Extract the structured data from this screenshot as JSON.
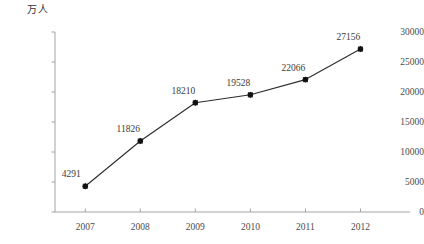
{
  "chart_data": {
    "type": "line",
    "title": "",
    "subtitle": "",
    "xlabel": "",
    "ylabel": "万人",
    "ylabel_position": "top-left-above-axis",
    "categories": [
      "2007",
      "2008",
      "2009",
      "2010",
      "2011",
      "2012"
    ],
    "x": [
      2007,
      2008,
      2009,
      2010,
      2011,
      2012
    ],
    "values": [
      4291,
      11826,
      18210,
      19528,
      22066,
      27156
    ],
    "data_labels": [
      "4291",
      "11826",
      "18210",
      "19528",
      "22066",
      "27156"
    ],
    "data_labels_visible": true,
    "ylim": [
      0,
      30000
    ],
    "yticks": [
      0,
      5000,
      10000,
      15000,
      20000,
      25000,
      30000
    ],
    "ytick_labels": [
      "0",
      "5000",
      "10000",
      "15000",
      "20000",
      "25000",
      "30000"
    ],
    "xtick_labels": [
      "2007",
      "2008",
      "2009",
      "2010",
      "2011",
      "2012"
    ],
    "grid": false,
    "legend": false,
    "legend_position": "none",
    "series": [
      {
        "name": "",
        "values": [
          4291,
          11826,
          18210,
          19528,
          22066,
          27156
        ],
        "marker": "diamond",
        "marker_color": "#101010",
        "line_color": "#2b2b2b"
      }
    ],
    "colors": {
      "line": "#2b2b2b",
      "marker": "#101010",
      "axis": "#9a9a9a",
      "text": "#3a3a3a",
      "background": "#ffffff"
    }
  }
}
